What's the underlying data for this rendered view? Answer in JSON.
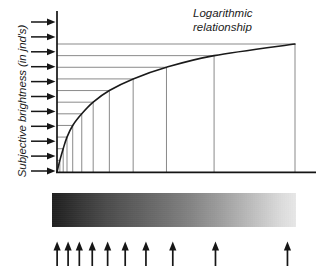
{
  "figure": {
    "title": "Logarithmic\nrelationship",
    "y_axis_label": "Subjective brightness (in jnd's)",
    "x_axis_label": ""
  },
  "chart_data": {
    "type": "line",
    "title": "Logarithmic relationship",
    "xlabel": "",
    "ylabel": "Subjective brightness (in jnd's)",
    "xlim": [
      0,
      100
    ],
    "ylim": [
      0,
      11
    ],
    "grid": true,
    "legend": false,
    "annotations": [
      "Logarithmic relationship"
    ],
    "series": [
      {
        "name": "Logarithmic relationship",
        "x": [
          0,
          1.2,
          2.6,
          4.2,
          6.6,
          10.4,
          15.2,
          22.0,
          32.0,
          46.0,
          66.0,
          100.0
        ],
        "y": [
          0,
          1,
          2,
          3,
          4,
          5,
          6,
          7,
          8,
          9,
          10,
          11
        ]
      }
    ],
    "jnd_levels": [
      1,
      2,
      3,
      4,
      5,
      6,
      7,
      8,
      9,
      10
    ],
    "intensity_arrow_positions_pct": [
      2.1,
      6.6,
      11.2,
      16.5,
      22.8,
      30.0,
      38.5,
      49.5,
      67.0,
      96.5
    ],
    "subjective_arrow_count": 11,
    "intensity_arrow_count": 10,
    "gradient_bar": {
      "from": "#151515",
      "to": "#f3f3f3",
      "direction": "left-to-right"
    }
  },
  "style": {
    "line_color": "#1a1a1a",
    "grid_color": "#565656",
    "axis_color": "#141414",
    "background": "#ffffff"
  }
}
